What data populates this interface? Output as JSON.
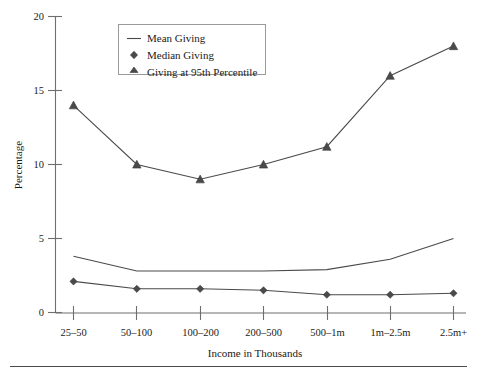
{
  "chart_data": {
    "type": "line",
    "title": "",
    "xlabel": "Income in Thousands",
    "ylabel": "Percentage",
    "categories": [
      "25–50",
      "50–100",
      "100–200",
      "200–500",
      "500–1m",
      "1m–2.5m",
      "2.5m+"
    ],
    "ylim": [
      0,
      20
    ],
    "yticks": [
      0,
      5,
      10,
      15,
      20
    ],
    "ytick_labels": [
      "0",
      "5",
      "10",
      "15",
      "20"
    ],
    "grid": false,
    "legend_position": "top-center",
    "series": [
      {
        "name": "Mean Giving",
        "marker": "none",
        "values": [
          3.8,
          2.8,
          2.8,
          2.8,
          2.9,
          3.6,
          5.0
        ]
      },
      {
        "name": "Median Giving",
        "marker": "diamond",
        "values": [
          2.1,
          1.6,
          1.6,
          1.5,
          1.2,
          1.2,
          1.3
        ]
      },
      {
        "name": "Giving at 95th Percentile",
        "marker": "triangle",
        "values": [
          14.0,
          10.0,
          9.0,
          10.0,
          11.2,
          16.0,
          18.0
        ]
      }
    ],
    "colors": {
      "line": "#4a4a4a",
      "axis": "#6e6e6e",
      "text": "#1a1a1a"
    }
  },
  "legend": {
    "items": [
      {
        "label": "Mean Giving",
        "marker": "line-marker"
      },
      {
        "label": "Median Giving",
        "marker": "diamond-marker"
      },
      {
        "label": "Giving at 95th Percentile",
        "marker": "triangle-marker"
      }
    ]
  }
}
